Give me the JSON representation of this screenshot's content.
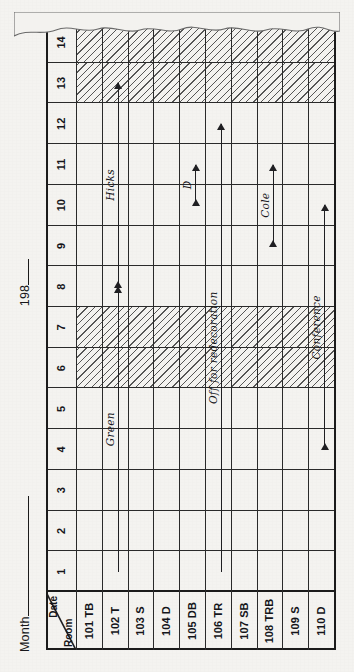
{
  "document": {
    "kind": "room-occupancy-chart",
    "title_month_label": "Month",
    "title_year_label": "198",
    "corner_top_label": "Date",
    "corner_bottom_label": "Room"
  },
  "dates": {
    "label": "Date",
    "columns": [
      "1",
      "2",
      "3",
      "4",
      "5",
      "6",
      "7",
      "8",
      "9",
      "10",
      "11",
      "12",
      "13",
      "14"
    ],
    "hatched": [
      "6",
      "7",
      "13",
      "14"
    ]
  },
  "rooms": {
    "label": "Room",
    "items": [
      {
        "code": "101 TB"
      },
      {
        "code": "102 T"
      },
      {
        "code": "103 S"
      },
      {
        "code": "104 D"
      },
      {
        "code": "105 DB"
      },
      {
        "code": "106 TR"
      },
      {
        "code": "107 SB"
      },
      {
        "code": "108 TRB"
      },
      {
        "code": "109 S"
      },
      {
        "code": "110 D"
      }
    ]
  },
  "bookings": [
    {
      "room": "102 T",
      "name": "Green",
      "from": 1,
      "to": 8,
      "start_cap": "none",
      "end_cap": "arrow"
    },
    {
      "room": "102 T",
      "name": "Hicks",
      "from": 8,
      "to": 13,
      "start_cap": "arrow",
      "end_cap": "arrow"
    },
    {
      "room": "105 DB",
      "name": "D",
      "from": 10,
      "to": 11,
      "start_cap": "arrow",
      "end_cap": "arrow"
    },
    {
      "room": "106 TR",
      "name": "Off for redecoration",
      "from": 1,
      "to": 12,
      "start_cap": "none",
      "end_cap": "arrow"
    },
    {
      "room": "108 TRB",
      "name": "Cole",
      "from": 9,
      "to": 11,
      "start_cap": "arrow",
      "end_cap": "arrow"
    },
    {
      "room": "110 D",
      "name": "Conference",
      "from": 4,
      "to": 10,
      "start_cap": "arrow",
      "end_cap": "arrow"
    }
  ],
  "colors": {
    "paper": "#f4f3f0",
    "ink": "#1b1b1b",
    "hatch": "#3a3a3a"
  }
}
